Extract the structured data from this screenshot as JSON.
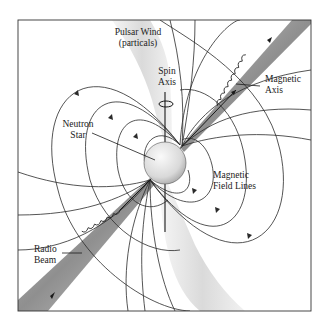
{
  "diagram": {
    "title": "Pulsar",
    "labels": {
      "pulsar_wind": "Pulsar Wind",
      "pulsar_wind_sub": "(particals)",
      "spin_axis_1": "Spin",
      "spin_axis_2": "Axis",
      "magnetic_axis_1": "Magnetic",
      "magnetic_axis_2": "Axis",
      "neutron_star_1": "Neutron",
      "neutron_star_2": "Star",
      "field_lines_1": "Magnetic",
      "field_lines_2": "Field Lines",
      "radio_beam_1": "Radio",
      "radio_beam_2": "Beam"
    },
    "colors": {
      "line": "#2a2a2a",
      "beam": "#9a9a9a",
      "wind": "#d8d8d8",
      "star": "#e6e6e6"
    }
  }
}
